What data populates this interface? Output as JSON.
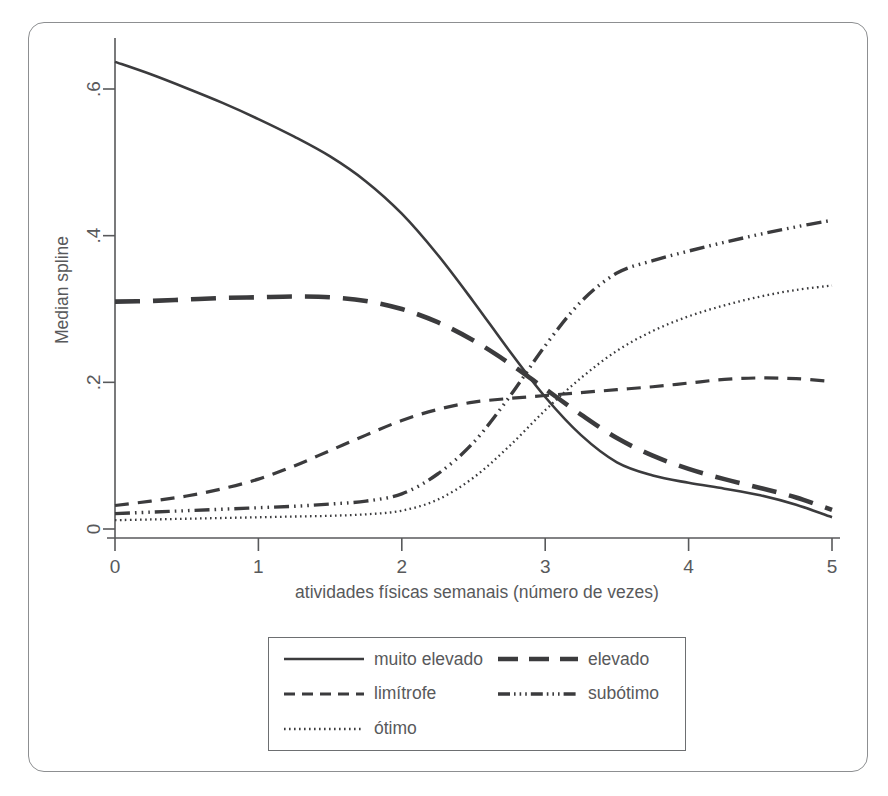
{
  "chart_data": {
    "type": "line",
    "title": "",
    "subtitle": "",
    "xlabel": "atividades físicas semanais (número de vezes)",
    "ylabel": "Median spline",
    "xlim": [
      0,
      5
    ],
    "ylim": [
      0,
      0.66
    ],
    "xticks": [
      0,
      1,
      2,
      3,
      4,
      5
    ],
    "xtick_labels": [
      "0",
      "1",
      "2",
      "3",
      "4",
      "5"
    ],
    "yticks": [
      0,
      0.2,
      0.4,
      0.6
    ],
    "ytick_labels": [
      "0",
      ".2",
      ".4",
      ".6"
    ],
    "grid": false,
    "legend_position": "below-center",
    "x": [
      0,
      0.25,
      0.5,
      0.75,
      1,
      1.25,
      1.5,
      1.75,
      2,
      2.25,
      2.5,
      2.75,
      3,
      3.25,
      3.5,
      3.75,
      4,
      4.25,
      4.5,
      4.75,
      5
    ],
    "series": [
      {
        "name": "muito elevado",
        "style": "solid",
        "values": [
          0.637,
          0.62,
          0.601,
          0.581,
          0.559,
          0.535,
          0.508,
          0.474,
          0.43,
          0.374,
          0.31,
          0.243,
          0.18,
          0.128,
          0.091,
          0.073,
          0.063,
          0.055,
          0.046,
          0.033,
          0.016
        ]
      },
      {
        "name": "elevado",
        "style": "long-dash",
        "values": [
          0.31,
          0.311,
          0.313,
          0.315,
          0.316,
          0.317,
          0.316,
          0.311,
          0.3,
          0.282,
          0.257,
          0.226,
          0.191,
          0.156,
          0.124,
          0.1,
          0.082,
          0.068,
          0.056,
          0.043,
          0.026
        ]
      },
      {
        "name": "limítrofe",
        "style": "dash",
        "values": [
          0.032,
          0.038,
          0.045,
          0.055,
          0.068,
          0.086,
          0.107,
          0.128,
          0.148,
          0.163,
          0.173,
          0.178,
          0.182,
          0.186,
          0.19,
          0.194,
          0.199,
          0.204,
          0.206,
          0.205,
          0.201
        ]
      },
      {
        "name": "subótimo",
        "style": "dash-dot-dot",
        "values": [
          0.021,
          0.023,
          0.025,
          0.027,
          0.029,
          0.031,
          0.034,
          0.038,
          0.048,
          0.075,
          0.118,
          0.18,
          0.25,
          0.31,
          0.349,
          0.366,
          0.379,
          0.391,
          0.402,
          0.412,
          0.421
        ]
      },
      {
        "name": "ótimo",
        "style": "dot",
        "values": [
          0.012,
          0.013,
          0.014,
          0.015,
          0.016,
          0.017,
          0.018,
          0.02,
          0.025,
          0.04,
          0.07,
          0.113,
          0.162,
          0.206,
          0.243,
          0.27,
          0.29,
          0.305,
          0.317,
          0.326,
          0.332
        ]
      }
    ]
  },
  "axes": {
    "ylabel": "Median spline",
    "xlabel": "atividades físicas semanais (número de vezes)",
    "ytick_labels": [
      "0",
      ".2",
      ".4",
      ".6"
    ],
    "xtick_labels": [
      "0",
      "1",
      "2",
      "3",
      "4",
      "5"
    ]
  },
  "legend": {
    "entries": [
      {
        "label": "muito elevado",
        "style": "solid"
      },
      {
        "label": "elevado",
        "style": "long-dash"
      },
      {
        "label": "limítrofe",
        "style": "dash"
      },
      {
        "label": "subótimo",
        "style": "dash-dot-dot"
      },
      {
        "label": "ótimo",
        "style": "dot"
      }
    ]
  },
  "colors": {
    "line": "#3b3b3d",
    "axis": "#58595b",
    "frame": "#8d8f91",
    "legend_border": "#6d6f71",
    "background": "#ffffff"
  }
}
